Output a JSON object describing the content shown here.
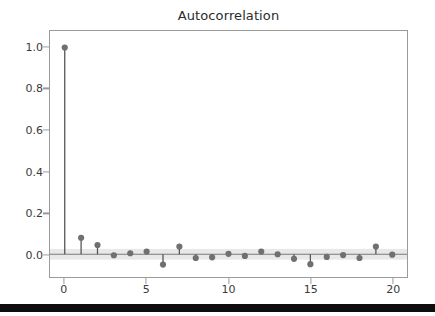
{
  "figure": {
    "title": "Autocorrelation",
    "background_color": "#ffffff",
    "bottom_bar_color": "#0d0d0d"
  },
  "axis": {
    "y_tick_labels": [
      "0.0",
      "0.2",
      "0.4",
      "0.6",
      "0.8",
      "1.0"
    ],
    "x_tick_labels": [
      "0",
      "5",
      "10",
      "15",
      "20"
    ],
    "frame_color": "#9a9a9a"
  },
  "chart_data": {
    "type": "line",
    "plot_kind": "stem-acf",
    "title": "Autocorrelation",
    "xlabel": "",
    "ylabel": "",
    "xlim": [
      -0.9,
      20.9
    ],
    "ylim": [
      -0.11,
      1.08
    ],
    "xticks": [
      0,
      5,
      10,
      15,
      20
    ],
    "yticks": [
      0.0,
      0.2,
      0.4,
      0.6,
      0.8,
      1.0
    ],
    "grid": false,
    "legend": null,
    "x": [
      0,
      1,
      2,
      3,
      4,
      5,
      6,
      7,
      8,
      9,
      10,
      11,
      12,
      13,
      14,
      15,
      16,
      17,
      18,
      19,
      20
    ],
    "values": [
      1.0,
      0.08,
      0.045,
      -0.005,
      0.005,
      0.013,
      -0.05,
      0.037,
      -0.018,
      -0.015,
      0.002,
      -0.008,
      0.013,
      0.0,
      -0.022,
      -0.048,
      -0.013,
      -0.004,
      -0.018,
      0.037,
      -0.002
    ],
    "confidence_band": {
      "upper": 0.026,
      "lower": -0.026,
      "color": "#e8e8e8"
    },
    "marker_color": "#707070",
    "stem_color": "#555555",
    "baseline_color": "#7a7a7a",
    "marker_size": 5
  }
}
